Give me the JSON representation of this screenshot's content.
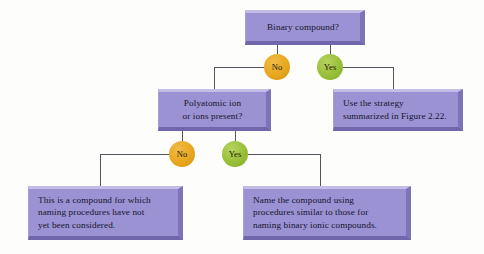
{
  "diagram": {
    "background_color": "#fdfdfc",
    "box_fill_color": "#9a92d2",
    "box_highlight_color": "#c3bde8",
    "box_shadow_color": "#6f66ab",
    "no_circle_color": "#e8a820",
    "yes_circle_color": "#9ac03a",
    "connector_color": "#55555f",
    "text_color": "#191430",
    "nodes": {
      "root_question": {
        "text": "Binary compound?",
        "type": "decision-box"
      },
      "polyatomic_question": {
        "line1": "Polyatomic ion",
        "line2": "or ions present?",
        "type": "decision-box"
      },
      "binary_strategy": {
        "line1": "Use the strategy",
        "line2": "summarized in Figure 2.22.",
        "type": "terminal-box"
      },
      "not_considered": {
        "line1": "This is a compound for which",
        "line2": "naming procedures have not",
        "line3": "yet been considered.",
        "type": "terminal-box"
      },
      "similar_procedures": {
        "line1": "Name the compound using",
        "line2": "procedures similar to those for",
        "line3": "naming binary ionic compounds.",
        "type": "terminal-box"
      }
    },
    "branches": {
      "root_no": "No",
      "root_yes": "Yes",
      "polyatomic_no": "No",
      "polyatomic_yes": "Yes"
    }
  }
}
